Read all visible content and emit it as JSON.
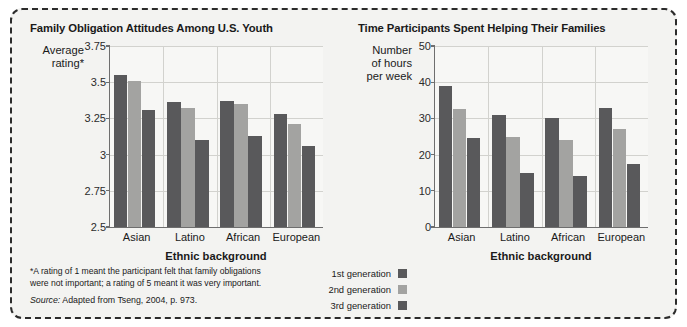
{
  "figure": {
    "footnote_line1": "*A rating of 1 meant the participant felt that family obligations",
    "footnote_line2": "were not important; a rating of 5 meant it was very important.",
    "source_prefix": "Source:",
    "source_text": " Adapted from Tseng, 2004, p. 973.",
    "legend": [
      {
        "label": "1st generation",
        "color": "#59595b"
      },
      {
        "label": "2nd generation",
        "color": "#a3a3a1"
      },
      {
        "label": "3rd generation",
        "color": "#59595b"
      }
    ]
  },
  "chart_data": [
    {
      "type": "bar",
      "title": "Family Obligation Attitudes Among U.S. Youth",
      "ylabel": "Average rating*",
      "ylabel_line1": "Average",
      "ylabel_line2": "rating*",
      "xlabel": "Ethnic background",
      "categories": [
        "Asian",
        "Latino",
        "African",
        "European"
      ],
      "yticks": [
        "3.75",
        "3.5",
        "3.25",
        "3",
        "2.75",
        "2.5"
      ],
      "ytick_values": [
        3.75,
        3.5,
        3.25,
        3,
        2.75,
        2.5
      ],
      "ylim": [
        2.5,
        3.75
      ],
      "grid": true,
      "legend_position": "bottom-center",
      "series": [
        {
          "name": "1st generation",
          "color": "#59595b",
          "values": [
            3.55,
            3.36,
            3.37,
            3.28
          ]
        },
        {
          "name": "2nd generation",
          "color": "#a3a3a1",
          "values": [
            3.51,
            3.32,
            3.35,
            3.21
          ]
        },
        {
          "name": "3rd generation",
          "color": "#59595b",
          "values": [
            3.31,
            3.1,
            3.13,
            3.06
          ]
        }
      ]
    },
    {
      "type": "bar",
      "title": "Time Participants Spent Helping Their Families",
      "ylabel": "Number of hours per week",
      "ylabel_line1": "Number",
      "ylabel_line2": "of hours",
      "ylabel_line3": "per week",
      "xlabel": "Ethnic background",
      "categories": [
        "Asian",
        "Latino",
        "African",
        "European"
      ],
      "yticks": [
        "50",
        "40",
        "30",
        "20",
        "10",
        "0"
      ],
      "ytick_values": [
        50,
        40,
        30,
        20,
        10,
        0
      ],
      "ylim": [
        0,
        50
      ],
      "grid": true,
      "legend_position": "bottom-center",
      "series": [
        {
          "name": "1st generation",
          "color": "#59595b",
          "values": [
            39,
            31,
            30,
            33
          ]
        },
        {
          "name": "2nd generation",
          "color": "#a3a3a1",
          "values": [
            32.5,
            25,
            24,
            27
          ]
        },
        {
          "name": "3rd generation",
          "color": "#59595b",
          "values": [
            24.5,
            15,
            14,
            17.5
          ]
        }
      ]
    }
  ]
}
